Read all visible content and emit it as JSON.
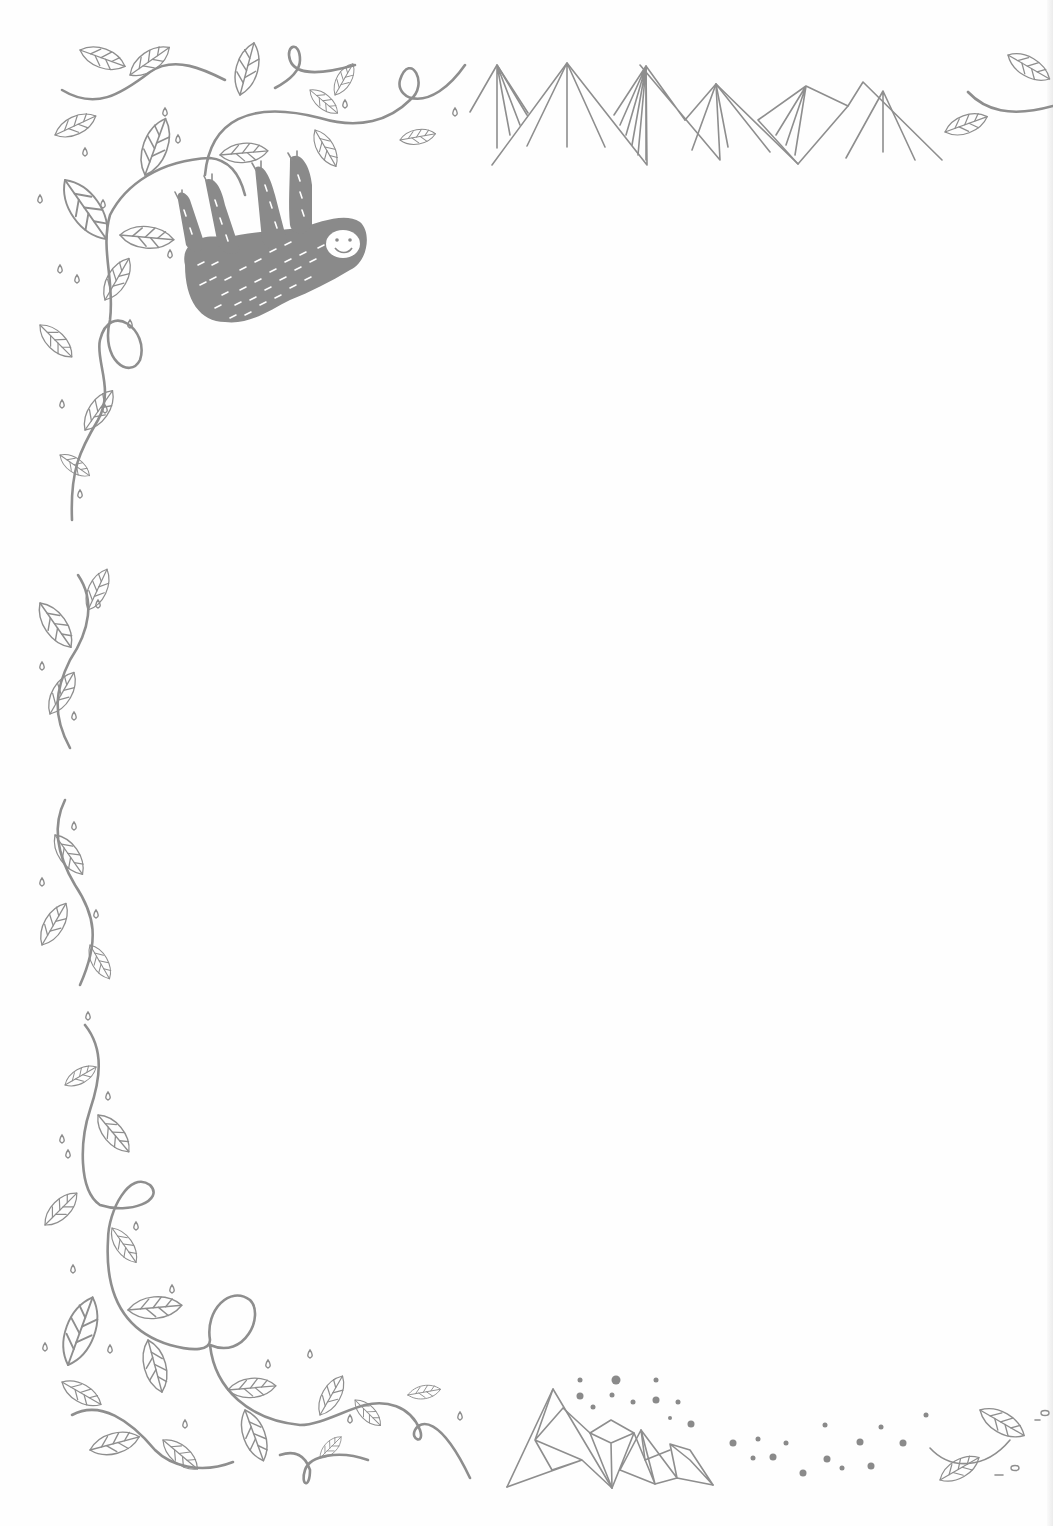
{
  "page": {
    "type": "decorative stationery sheet",
    "background_color": "#ffffff",
    "line_color": "#8e8e8e"
  },
  "decorations": {
    "top_left": "vine-with-leaves-and-hanging-sloth",
    "top_center": "geometric-line-mountains",
    "top_right": "leaf-sprig",
    "left_side": [
      "vine-segment-upper",
      "vine-segment-lower"
    ],
    "bottom_left": "vine-corner-with-loops",
    "bottom_center": "faceted-crystal-mountains",
    "bottom_right": "scattered-dots-and-leaf-sprig"
  },
  "writing_area": {
    "content": ""
  }
}
